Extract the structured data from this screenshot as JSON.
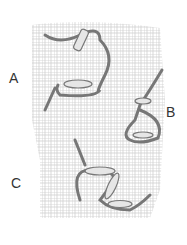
{
  "figure": {
    "labels": {
      "a": "A",
      "b": "B",
      "c": "C"
    },
    "colors": {
      "mesh": "#c8c8c8",
      "thread": "#888888",
      "thread_fill": "#e6e6e6"
    }
  }
}
